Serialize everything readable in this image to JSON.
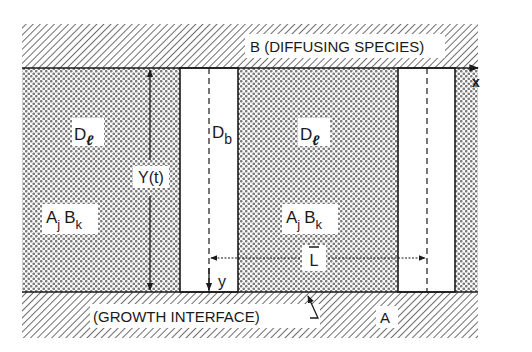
{
  "diagram": {
    "type": "schematic",
    "colors": {
      "ink": "#1a1a1a",
      "paper": "#ffffff",
      "hatch": "#7a7a7a",
      "crosshatch": "#8c8c8c"
    },
    "regions": {
      "top_band": {
        "label": "B (DIFFUSING SPECIES)"
      },
      "bottom_band": {
        "label": "A"
      },
      "interface_label": "(GROWTH INTERFACE)"
    },
    "labels": {
      "d_l_left": "D",
      "d_l_left_sub": "ℓ",
      "d_b": "D",
      "d_b_sub": "b",
      "d_l_right": "D",
      "d_l_right_sub": "ℓ",
      "phase_left_a": "A",
      "phase_left_j": "j",
      "phase_left_b": "B",
      "phase_left_k": "k",
      "phase_right_a": "A",
      "phase_right_j": "j",
      "phase_right_b": "B",
      "phase_right_k": "k",
      "thickness": "Y(t)",
      "y_axis": "y",
      "x_axis": "x",
      "spacing": "L"
    }
  }
}
